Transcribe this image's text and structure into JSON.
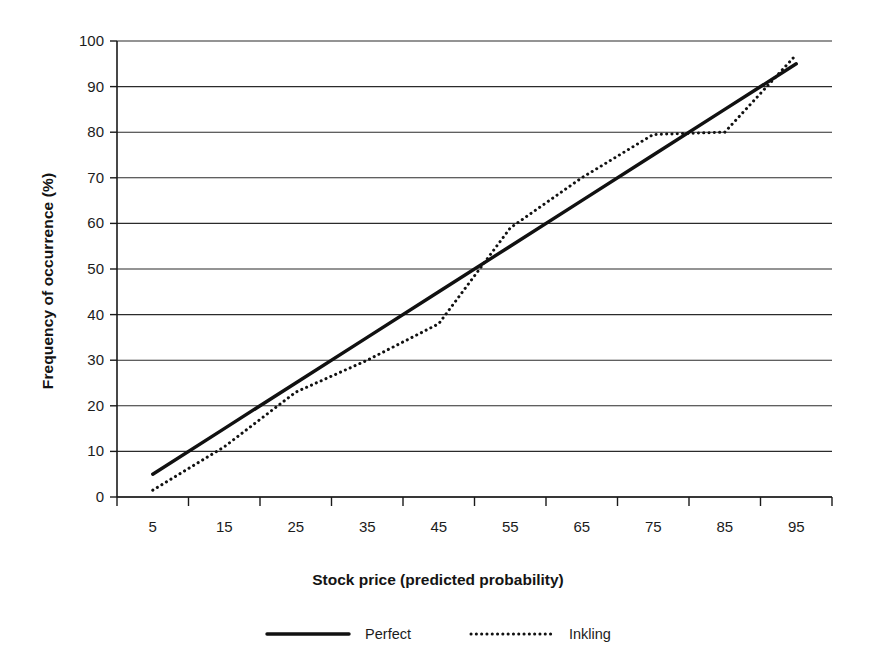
{
  "chart_data": {
    "type": "line",
    "title": "",
    "xlabel": "Stock price (predicted probability)",
    "ylabel": "Frequency of occurrence (%)",
    "categories": [
      "5",
      "15",
      "25",
      "35",
      "45",
      "55",
      "65",
      "75",
      "85",
      "95"
    ],
    "x": [
      5,
      15,
      25,
      35,
      45,
      55,
      65,
      75,
      85,
      95
    ],
    "xlim": [
      0,
      100
    ],
    "ylim": [
      0,
      100
    ],
    "yticks": [
      0,
      10,
      20,
      30,
      40,
      50,
      60,
      70,
      80,
      90,
      100
    ],
    "grid": "horizontal",
    "legend_position": "bottom",
    "series": [
      {
        "name": "Perfect",
        "style": "solid",
        "color": "#111111",
        "values": [
          5,
          15,
          25,
          35,
          45,
          55,
          65,
          75,
          85,
          95
        ]
      },
      {
        "name": "Inkling",
        "style": "dotted",
        "color": "#111111",
        "values": [
          1.5,
          11,
          23,
          30,
          38,
          59,
          70,
          79.5,
          80,
          97
        ]
      }
    ]
  },
  "axes": {
    "y_tick_labels": [
      "100",
      "90",
      "80",
      "70",
      "60",
      "50",
      "40",
      "30",
      "20",
      "10",
      "0"
    ],
    "x_tick_labels": [
      "5",
      "15",
      "25",
      "35",
      "45",
      "55",
      "65",
      "75",
      "85",
      "95"
    ],
    "y_axis_title": "Frequency of occurrence (%)",
    "x_axis_title": "Stock price (predicted probability)"
  },
  "legend": {
    "items": [
      {
        "label": "Perfect",
        "style": "solid"
      },
      {
        "label": "Inkling",
        "style": "dotted"
      }
    ]
  }
}
